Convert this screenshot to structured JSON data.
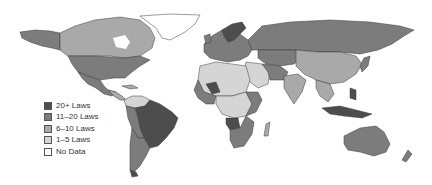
{
  "map": {
    "type": "choropleth world map",
    "colors": {
      "20_plus": "#4d4d4d",
      "11_20": "#7c7c7c",
      "6_10": "#a9a9a9",
      "1_5": "#d5d5d5",
      "no_data": "#ffffff"
    }
  },
  "legend": {
    "items": [
      {
        "label": "20+ Laws",
        "color": "#4d4d4d"
      },
      {
        "label": "11–20 Laws",
        "color": "#7c7c7c"
      },
      {
        "label": "6–10 Laws",
        "color": "#a9a9a9"
      },
      {
        "label": "1–5 Laws",
        "color": "#d5d5d5"
      },
      {
        "label": "No Data",
        "color": "#ffffff"
      }
    ]
  }
}
